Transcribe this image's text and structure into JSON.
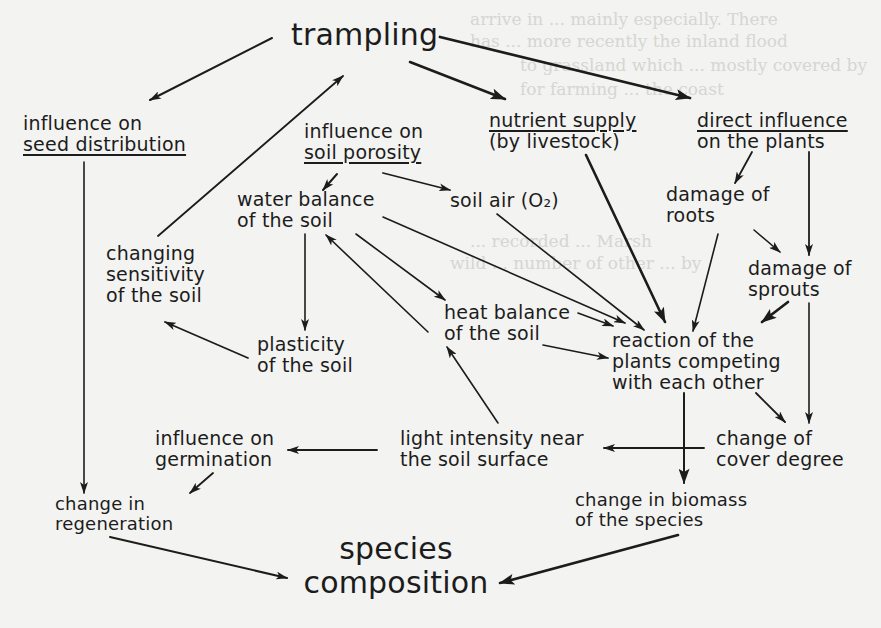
{
  "diagram": {
    "title": "trampling",
    "outcome": [
      "species",
      "composition"
    ],
    "nodes": {
      "trampling": {
        "lines": [
          "trampling"
        ]
      },
      "seed_distribution": {
        "lines": [
          "influence on",
          "seed distribution"
        ],
        "underlined_line": 1
      },
      "soil_porosity": {
        "lines": [
          "influence on",
          "soil porosity"
        ],
        "underlined_line": 1
      },
      "nutrient_supply": {
        "lines": [
          "nutrient supply",
          "(by livestock)"
        ],
        "underlined_line": 0
      },
      "direct_influence": {
        "lines": [
          "direct influence",
          "on the plants"
        ],
        "underlined_line": 0
      },
      "water_balance": {
        "lines": [
          "water balance",
          "of the soil"
        ]
      },
      "soil_air": {
        "lines": [
          "soil air (O₂)"
        ]
      },
      "damage_roots": {
        "lines": [
          "damage of",
          "roots"
        ]
      },
      "changing_sensitivity": {
        "lines": [
          "changing",
          "sensitivity",
          "of the soil"
        ]
      },
      "damage_sprouts": {
        "lines": [
          "damage of",
          "sprouts"
        ]
      },
      "heat_balance": {
        "lines": [
          "heat balance",
          "of the soil"
        ]
      },
      "plasticity": {
        "lines": [
          "plasticity",
          "of the soil"
        ]
      },
      "reaction": {
        "lines": [
          "reaction of the",
          "plants competing",
          "with each other"
        ]
      },
      "germination": {
        "lines": [
          "influence on",
          "germination"
        ]
      },
      "light_intensity": {
        "lines": [
          "light intensity near",
          "the soil surface"
        ]
      },
      "cover_degree": {
        "lines": [
          "change of",
          "cover degree"
        ]
      },
      "regeneration": {
        "lines": [
          "change in",
          "regeneration"
        ]
      },
      "biomass": {
        "lines": [
          "change in biomass",
          "of the species"
        ]
      },
      "species_composition": {
        "lines": [
          "species",
          "composition"
        ]
      }
    },
    "edges": [
      {
        "from": "trampling",
        "to": "seed_distribution"
      },
      {
        "from": "trampling",
        "to": "nutrient_supply"
      },
      {
        "from": "trampling",
        "to": "direct_influence"
      },
      {
        "from": "changing_sensitivity",
        "to": "trampling"
      },
      {
        "from": "soil_porosity",
        "to": "water_balance"
      },
      {
        "from": "soil_porosity",
        "to": "soil_air"
      },
      {
        "from": "direct_influence",
        "to": "damage_roots"
      },
      {
        "from": "direct_influence",
        "to": "damage_sprouts"
      },
      {
        "from": "damage_roots",
        "to": "damage_sprouts"
      },
      {
        "from": "damage_roots",
        "to": "reaction"
      },
      {
        "from": "damage_sprouts",
        "to": "reaction"
      },
      {
        "from": "damage_sprouts",
        "to": "cover_degree"
      },
      {
        "from": "nutrient_supply",
        "to": "reaction"
      },
      {
        "from": "soil_air",
        "to": "reaction"
      },
      {
        "from": "water_balance",
        "to": "reaction"
      },
      {
        "from": "water_balance",
        "to": "heat_balance"
      },
      {
        "from": "water_balance",
        "to": "plasticity"
      },
      {
        "from": "heat_balance",
        "to": "water_balance"
      },
      {
        "from": "heat_balance",
        "to": "reaction"
      },
      {
        "from": "plasticity",
        "to": "changing_sensitivity"
      },
      {
        "from": "light_intensity",
        "to": "heat_balance"
      },
      {
        "from": "reaction",
        "to": "cover_degree"
      },
      {
        "from": "reaction",
        "to": "biomass"
      },
      {
        "from": "cover_degree",
        "to": "light_intensity"
      },
      {
        "from": "light_intensity",
        "to": "germination"
      },
      {
        "from": "germination",
        "to": "regeneration"
      },
      {
        "from": "seed_distribution",
        "to": "regeneration"
      },
      {
        "from": "regeneration",
        "to": "species_composition"
      },
      {
        "from": "biomass",
        "to": "species_composition"
      }
    ],
    "colors": {
      "ink": "#1c1c1c",
      "paper": "#f3f3f1",
      "bleed_through": "#d6d6d2"
    }
  }
}
